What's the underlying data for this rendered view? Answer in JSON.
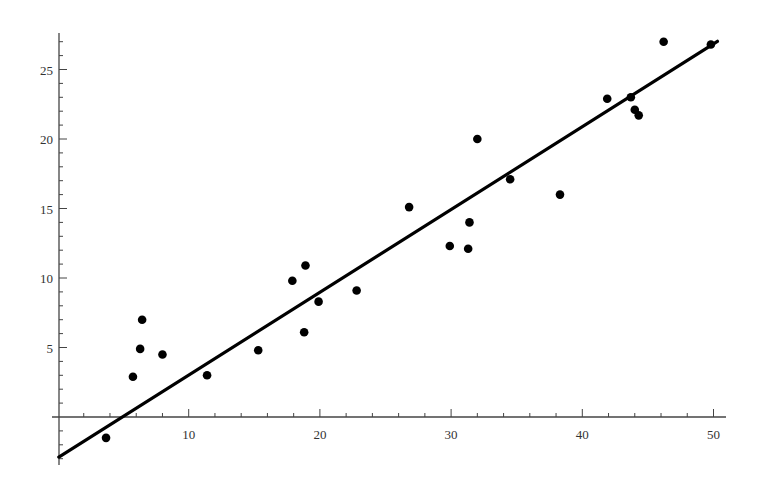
{
  "chart_data": {
    "type": "scatter",
    "title": "",
    "xlabel": "",
    "ylabel": "",
    "xlim": [
      0,
      51
    ],
    "ylim": [
      -3.5,
      27.6
    ],
    "grid": false,
    "legend": null,
    "x_ticks": [
      10,
      20,
      30,
      40,
      50
    ],
    "x_tick_labels": [
      "10",
      "20",
      "30",
      "40",
      "50"
    ],
    "x_minor_step": 2,
    "y_ticks": [
      5,
      10,
      15,
      20,
      25
    ],
    "y_tick_labels": [
      "5",
      "10",
      "15",
      "20",
      "25"
    ],
    "y_minor_step": 1,
    "series": [
      {
        "name": "data",
        "kind": "points",
        "color": "#000000",
        "points": [
          [
            3.7,
            -1.5
          ],
          [
            5.75,
            2.9
          ],
          [
            6.3,
            4.9
          ],
          [
            6.45,
            7.0
          ],
          [
            8.0,
            4.5
          ],
          [
            11.4,
            3.0
          ],
          [
            15.3,
            4.8
          ],
          [
            17.9,
            9.8
          ],
          [
            18.8,
            6.1
          ],
          [
            18.9,
            10.9
          ],
          [
            19.9,
            8.3
          ],
          [
            22.8,
            9.1
          ],
          [
            26.8,
            15.1
          ],
          [
            29.9,
            12.3
          ],
          [
            31.3,
            12.1
          ],
          [
            31.4,
            14.0
          ],
          [
            32.0,
            20.0
          ],
          [
            34.5,
            17.1
          ],
          [
            38.3,
            16.0
          ],
          [
            41.9,
            22.9
          ],
          [
            43.7,
            23.0
          ],
          [
            44.0,
            22.1
          ],
          [
            44.3,
            21.7
          ],
          [
            46.2,
            27.0
          ],
          [
            49.8,
            26.8
          ]
        ]
      },
      {
        "name": "fit line",
        "kind": "line",
        "color": "#000000",
        "slope": 0.596,
        "intercept": -2.95,
        "x_range": [
          0.1,
          50.3
        ]
      }
    ]
  },
  "plot_area": {
    "origin_px": [
      57.5,
      417
    ],
    "x_px_per_unit": 13.12,
    "y_px_per_unit": 13.9,
    "y_axis_px": 59,
    "x_axis_end_px": 726,
    "y_axis_top_px": 33,
    "y_axis_bottom_px": 465
  }
}
